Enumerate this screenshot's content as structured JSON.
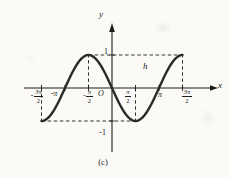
{
  "figure": {
    "caption": "(c)",
    "curve_label": "h",
    "y_axis_label": "y",
    "x_axis_label": "x",
    "origin_label": "O",
    "y_tick_labels": {
      "pos": "1",
      "neg": "-1"
    },
    "x_tick_labels": [
      {
        "kind": "frac",
        "sign": "-",
        "num": "3π",
        "den": "2"
      },
      {
        "kind": "plain",
        "text": "-π"
      },
      {
        "kind": "frac",
        "sign": "-",
        "num": "π",
        "den": "2"
      },
      {
        "kind": "frac",
        "sign": "",
        "num": "π",
        "den": "2"
      },
      {
        "kind": "plain",
        "text": "π"
      },
      {
        "kind": "frac",
        "sign": "",
        "num": "3π",
        "den": "2"
      }
    ]
  },
  "chart_data": {
    "type": "line",
    "title": "",
    "function": "y = -sin(x)",
    "function_js": "-Math.sin(x)",
    "x_range_radians": [
      -4.71239,
      4.71239
    ],
    "ylim": [
      -1,
      1
    ],
    "x_ticks_radians": [
      -4.71239,
      -3.14159,
      -1.5708,
      1.5708,
      3.14159,
      4.71239
    ],
    "x_tick_labels": [
      "-3π/2",
      "-π",
      "-π/2",
      "π/2",
      "π",
      "3π/2"
    ],
    "y_ticks": [
      1,
      -1
    ],
    "y_tick_labels": [
      "1",
      "-1"
    ],
    "key_points": [
      [
        -4.71239,
        -1
      ],
      [
        -3.14159,
        0
      ],
      [
        -1.5708,
        1
      ],
      [
        0,
        0
      ],
      [
        1.5708,
        -1
      ],
      [
        3.14159,
        0
      ],
      [
        4.71239,
        1
      ]
    ],
    "curve_label": "h",
    "caption": "(c)",
    "grid": false,
    "legend": false,
    "dashed_guides": {
      "horizontal": [
        {
          "y": 1,
          "x_from": -1.5708,
          "x_to": 4.71239
        },
        {
          "y": -1,
          "x_from": -4.71239,
          "x_to": 1.5708
        }
      ],
      "vertical": [
        {
          "x": -4.71239,
          "y_from": 0,
          "y_to": -1
        },
        {
          "x": -1.5708,
          "y_from": 0,
          "y_to": 1
        },
        {
          "x": 1.5708,
          "y_from": 0,
          "y_to": -1
        },
        {
          "x": 4.71239,
          "y_from": 0,
          "y_to": 1
        }
      ]
    }
  },
  "colors": {
    "ink": "#1c1c1c",
    "curve": "#2a2a2a",
    "background": "#fbfaf7"
  }
}
